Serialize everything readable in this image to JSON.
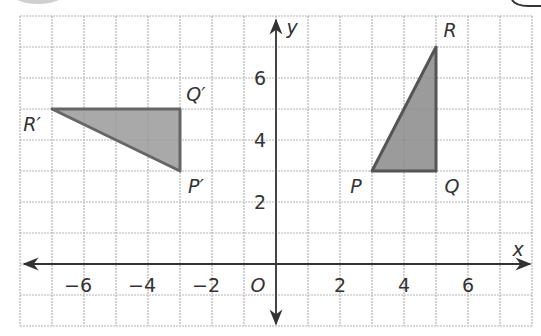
{
  "figure": {
    "type": "coordinate-plane",
    "x_range": [
      -8,
      8
    ],
    "y_range": [
      -2,
      8
    ],
    "grid": true,
    "axis_labels": {
      "x": "x",
      "y": "y",
      "origin": "O"
    },
    "x_ticks": [
      {
        "value": -6,
        "label": "−6"
      },
      {
        "value": -4,
        "label": "−4"
      },
      {
        "value": -2,
        "label": "−2"
      },
      {
        "value": 2,
        "label": "2"
      },
      {
        "value": 4,
        "label": "4"
      },
      {
        "value": 6,
        "label": "6"
      }
    ],
    "y_ticks": [
      {
        "value": 2,
        "label": "2"
      },
      {
        "value": 4,
        "label": "4"
      },
      {
        "value": 6,
        "label": "6"
      }
    ],
    "triangles": [
      {
        "name": "PQR",
        "fill": "#8a8a8a",
        "stroke": "#555555",
        "vertices": [
          {
            "label": "P",
            "x": 3,
            "y": 3
          },
          {
            "label": "Q",
            "x": 5,
            "y": 3
          },
          {
            "label": "R",
            "x": 5,
            "y": 7
          }
        ]
      },
      {
        "name": "P'Q'R'",
        "fill": "#9a9a9a",
        "stroke": "#666666",
        "vertices": [
          {
            "label": "P′",
            "x": -3,
            "y": 3
          },
          {
            "label": "Q′",
            "x": -3,
            "y": 5
          },
          {
            "label": "R′",
            "x": -7,
            "y": 5
          }
        ]
      }
    ]
  },
  "colors": {
    "grid": "#b5b5b5",
    "axis": "#333333",
    "text": "#333333"
  }
}
